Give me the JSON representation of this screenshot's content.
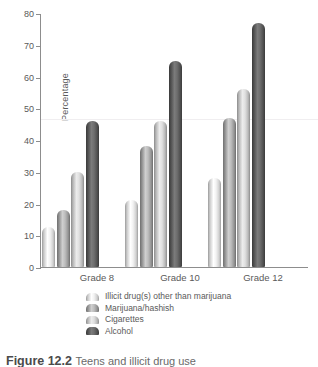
{
  "chart_data": {
    "type": "bar",
    "title": "",
    "xlabel": "",
    "ylabel": "Percentage",
    "ylim": [
      0,
      80
    ],
    "yticks": [
      0,
      10,
      20,
      30,
      40,
      50,
      60,
      70,
      80
    ],
    "grid": false,
    "legend_position": "bottom",
    "categories": [
      "Grade 8",
      "Grade 10",
      "Grade 12"
    ],
    "series": [
      {
        "name": "Illicit drug(s) other than marijuana",
        "color": "#f2f2f2",
        "values": [
          12.5,
          21,
          28
        ]
      },
      {
        "name": "Marijuana/hashish",
        "color": "#bdbdbd",
        "values": [
          18,
          38,
          47
        ]
      },
      {
        "name": "Cigarettes",
        "color": "#e0e0e0",
        "values": [
          30,
          46,
          56
        ]
      },
      {
        "name": "Alcohol",
        "color": "#6e6e6e",
        "values": [
          46,
          65,
          77
        ]
      }
    ]
  },
  "axis": {
    "y_label": "Percentage",
    "tick_0": "0",
    "tick_10": "10",
    "tick_20": "20",
    "tick_30": "30",
    "tick_40": "40",
    "tick_50": "50",
    "tick_60": "60",
    "tick_70": "70",
    "tick_80": "80"
  },
  "groups": [
    {
      "label": "Grade 8"
    },
    {
      "label": "Grade 10"
    },
    {
      "label": "Grade 12"
    }
  ],
  "legend": {
    "items": [
      {
        "label": "Illicit drug(s) other than marijuana"
      },
      {
        "label": "Marijuana/hashish"
      },
      {
        "label": "Cigarettes"
      },
      {
        "label": "Alcohol"
      }
    ]
  },
  "caption": {
    "number": "Figure 12.2",
    "text": "Teens and illicit drug use"
  }
}
